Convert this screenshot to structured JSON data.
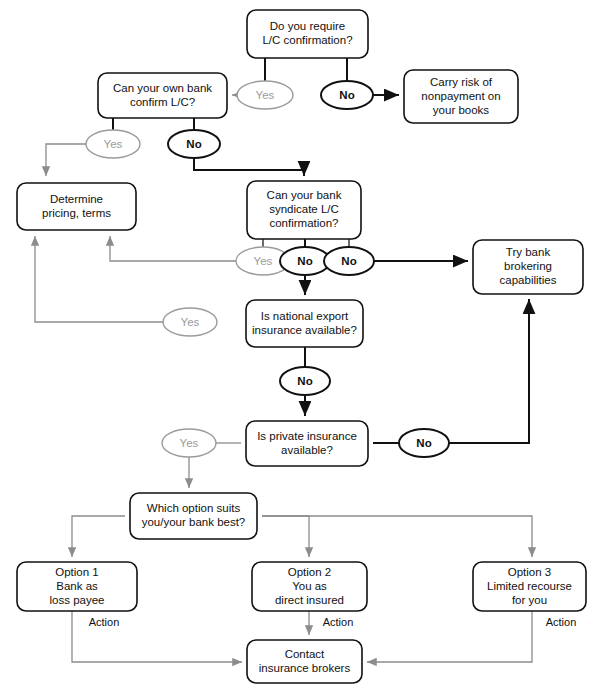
{
  "diagram": {
    "colors": {
      "background": "#ffffff",
      "node_stroke": "#111111",
      "node_fill": "#ffffff",
      "text": "#111111",
      "yes_oval_stroke": "#9b9b9b",
      "yes_oval_text": "#9b9b9b",
      "no_oval_stroke": "#111111",
      "edge_strong": "#111111",
      "edge_light": "#8c8c8c",
      "edge_mid": "#3a3a3a"
    },
    "nodes": [
      {
        "id": "require-confirmation",
        "kind": "decision-box",
        "lines": [
          "Do you require",
          "L/C confirmation?"
        ],
        "x": 247,
        "y": 10,
        "w": 121,
        "h": 48
      },
      {
        "id": "own-bank-confirm",
        "kind": "decision-box",
        "lines": [
          "Can your own bank",
          "confirm L/C?"
        ],
        "x": 98,
        "y": 73,
        "w": 129,
        "h": 45
      },
      {
        "id": "carry-risk",
        "kind": "action-box",
        "lines": [
          "Carry risk of",
          "nonpayment on",
          "your books"
        ],
        "x": 404,
        "y": 70,
        "w": 114,
        "h": 53
      },
      {
        "id": "determine-pricing",
        "kind": "action-box",
        "lines": [
          "Determine",
          "pricing, terms"
        ],
        "x": 17,
        "y": 183,
        "w": 119,
        "h": 47
      },
      {
        "id": "syndicate-confirmation",
        "kind": "decision-box",
        "lines": [
          "Can your bank",
          "syndicate L/C",
          "confirmation?"
        ],
        "x": 247,
        "y": 181,
        "w": 114,
        "h": 58
      },
      {
        "id": "try-bank-brokering",
        "kind": "action-box",
        "lines": [
          "Try bank",
          "brokering",
          "capabilities"
        ],
        "x": 473,
        "y": 240,
        "w": 110,
        "h": 54
      },
      {
        "id": "national-export-insurance",
        "kind": "decision-box",
        "lines": [
          "Is national export",
          "insurance available?"
        ],
        "x": 246,
        "y": 300,
        "w": 117,
        "h": 47
      },
      {
        "id": "private-insurance",
        "kind": "decision-box",
        "lines": [
          "Is private insurance",
          "available?"
        ],
        "x": 246,
        "y": 421,
        "w": 122,
        "h": 45
      },
      {
        "id": "which-option",
        "kind": "decision-box",
        "lines": [
          "Which option suits",
          "you/your bank best?"
        ],
        "x": 130,
        "y": 493,
        "w": 127,
        "h": 46
      },
      {
        "id": "option-1",
        "kind": "action-box",
        "lines": [
          "Option 1",
          "Bank as",
          "loss payee"
        ],
        "x": 17,
        "y": 562,
        "w": 120,
        "h": 49
      },
      {
        "id": "option-2",
        "kind": "action-box",
        "lines": [
          "Option 2",
          "You as",
          "direct insured"
        ],
        "x": 252,
        "y": 562,
        "w": 115,
        "h": 49
      },
      {
        "id": "option-3",
        "kind": "action-box",
        "lines": [
          "Option 3",
          "Limited recourse",
          "for you"
        ],
        "x": 473,
        "y": 562,
        "w": 113,
        "h": 49
      },
      {
        "id": "contact-brokers",
        "kind": "action-box",
        "lines": [
          "Contact",
          "insurance brokers"
        ],
        "x": 247,
        "y": 640,
        "w": 115,
        "h": 43
      }
    ],
    "ovals": [
      {
        "id": "yes-require",
        "label": "Yes",
        "style": "yes",
        "cx": 265,
        "cy": 95,
        "rx": 28,
        "ry": 14
      },
      {
        "id": "no-require",
        "label": "No",
        "style": "no",
        "cx": 347,
        "cy": 95,
        "rx": 26,
        "ry": 14
      },
      {
        "id": "yes-own-bank",
        "label": "Yes",
        "style": "yes",
        "cx": 113,
        "cy": 144,
        "rx": 27,
        "ry": 14
      },
      {
        "id": "no-own-bank",
        "label": "No",
        "style": "no",
        "cx": 194,
        "cy": 144,
        "rx": 26,
        "ry": 14
      },
      {
        "id": "yes-syndicate",
        "label": "Yes",
        "style": "yes",
        "cx": 263,
        "cy": 261,
        "rx": 27,
        "ry": 14
      },
      {
        "id": "no-syndicate-a",
        "label": "No",
        "style": "no",
        "cx": 305,
        "cy": 261,
        "rx": 25,
        "ry": 14
      },
      {
        "id": "no-syndicate-b",
        "label": "No",
        "style": "no",
        "cx": 349,
        "cy": 261,
        "rx": 25,
        "ry": 14
      },
      {
        "id": "yes-national",
        "label": "Yes",
        "style": "yes",
        "cx": 190,
        "cy": 322,
        "rx": 27,
        "ry": 14
      },
      {
        "id": "no-national",
        "label": "No",
        "style": "no",
        "cx": 305,
        "cy": 381,
        "rx": 25,
        "ry": 14
      },
      {
        "id": "yes-private",
        "label": "Yes",
        "style": "yes",
        "cx": 189,
        "cy": 443,
        "rx": 27,
        "ry": 14
      },
      {
        "id": "no-private",
        "label": "No",
        "style": "no",
        "cx": 424,
        "cy": 443,
        "rx": 25,
        "ry": 14
      }
    ],
    "edge_labels": [
      {
        "id": "action-1",
        "text": "Action",
        "x": 104,
        "y": 623
      },
      {
        "id": "action-2",
        "text": "Action",
        "x": 338,
        "y": 623
      },
      {
        "id": "action-3",
        "text": "Action",
        "x": 561,
        "y": 623
      }
    ],
    "edges": [
      {
        "id": "e-require-to-yes",
        "style": "strong",
        "d": "M 265 58 L 265 81"
      },
      {
        "id": "e-require-to-no",
        "style": "strong",
        "d": "M 347 58 L 347 81"
      },
      {
        "id": "e-yes-to-ownbank",
        "style": "light",
        "arrow": "light",
        "d": "M 237 95 L 232 95"
      },
      {
        "id": "e-no-to-carryrisk",
        "style": "strong",
        "arrow": "strong",
        "d": "M 373 95 L 399 95"
      },
      {
        "id": "e-ownbank-to-yes",
        "style": "strong",
        "d": "M 113 118 L 113 130"
      },
      {
        "id": "e-ownbank-to-no",
        "style": "strong",
        "d": "M 194 118 L 194 130"
      },
      {
        "id": "e-yes-ownbank-to-pricing",
        "style": "light",
        "arrow": "light",
        "d": "M 86 144 L 46 144 L 46 176"
      },
      {
        "id": "e-no-ownbank-to-syndicate",
        "style": "strong",
        "arrow": "strong",
        "d": "M 194 158 L 194 170 L 304 170 L 304 176"
      },
      {
        "id": "e-syndicate-to-yes",
        "style": "mid",
        "d": "M 263 239 L 263 247"
      },
      {
        "id": "e-syndicate-to-no-a",
        "style": "strong",
        "d": "M 305 239 L 305 247"
      },
      {
        "id": "e-syndicate-to-no-b",
        "style": "mid",
        "d": "M 349 239 L 349 247"
      },
      {
        "id": "e-yes-syndicate-to-pricing",
        "style": "light",
        "arrow": "light",
        "d": "M 236 261 L 110 261 L 110 236"
      },
      {
        "id": "e-no-syndicate-b-to-brokering",
        "style": "strong",
        "arrow": "strong",
        "d": "M 374 261 L 468 261"
      },
      {
        "id": "e-no-syndicate-a-to-national",
        "style": "strong",
        "arrow": "strong",
        "d": "M 305 275 L 305 295"
      },
      {
        "id": "e-yes-national-to-pricing",
        "style": "light",
        "arrow": "light",
        "d": "M 163 322 L 35 322 L 35 236"
      },
      {
        "id": "e-national-to-no",
        "style": "strong",
        "d": "M 305 347 L 305 367"
      },
      {
        "id": "e-no-national-to-private",
        "style": "strong",
        "arrow": "strong",
        "d": "M 305 395 L 305 416"
      },
      {
        "id": "e-private-to-yes",
        "style": "light",
        "d": "M 241 443 L 216 443"
      },
      {
        "id": "e-yes-private-to-whichoption",
        "style": "light",
        "arrow": "light",
        "d": "M 189 457 L 189 488"
      },
      {
        "id": "e-private-to-no",
        "style": "strong",
        "d": "M 373 443 L 399 443"
      },
      {
        "id": "e-no-private-to-brokering",
        "style": "strong",
        "arrow": "strong",
        "d": "M 449 443 L 529 443 L 529 299"
      },
      {
        "id": "e-whichoption-to-option1",
        "style": "light",
        "arrow": "light",
        "d": "M 125 516 L 72 516 L 72 557"
      },
      {
        "id": "e-whichoption-to-option2",
        "style": "light",
        "arrow": "light",
        "d": "M 262 516 L 309 516 L 309 557"
      },
      {
        "id": "e-whichoption-to-option3",
        "style": "light",
        "arrow": "light",
        "d": "M 262 516 L 532 516 L 532 557"
      },
      {
        "id": "e-option1-to-contact",
        "style": "light",
        "arrow": "light",
        "d": "M 72 611 L 72 662 L 242 662"
      },
      {
        "id": "e-option2-to-contact",
        "style": "light",
        "arrow": "light",
        "d": "M 309 611 L 309 635"
      },
      {
        "id": "e-option3-to-contact",
        "style": "light",
        "arrow": "light",
        "d": "M 532 611 L 532 662 L 367 662"
      }
    ]
  }
}
